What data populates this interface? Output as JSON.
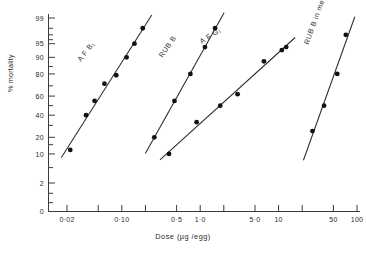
{
  "chart_data": {
    "type": "scatter",
    "title": "",
    "xlabel": "Dose (µg /egg)",
    "ylabel": "% mortality",
    "xscale": "log",
    "yscale": "probit",
    "xlim": [
      0.015,
      120
    ],
    "ylim": [
      0,
      99
    ],
    "grid": false,
    "legend": "inline-labels",
    "xticks": [
      "0·02",
      "0·10",
      "0·5",
      "1·0",
      "5·0",
      "10",
      "50",
      "100"
    ],
    "xtick_values": [
      0.02,
      0.1,
      0.5,
      1.0,
      5.0,
      10,
      50,
      100
    ],
    "yticks": [
      "99",
      "95",
      "90",
      "80",
      "60",
      "40",
      "20",
      "10",
      "2",
      "0"
    ],
    "ytick_values": [
      99,
      95,
      90,
      80,
      60,
      40,
      20,
      10,
      2,
      0
    ],
    "series": [
      {
        "name": "A.F. B₁",
        "label": "A F  B₁",
        "points": [
          {
            "x": 0.022,
            "y": 12
          },
          {
            "x": 0.035,
            "y": 40
          },
          {
            "x": 0.045,
            "y": 55
          },
          {
            "x": 0.06,
            "y": 72
          },
          {
            "x": 0.085,
            "y": 79
          },
          {
            "x": 0.115,
            "y": 90
          },
          {
            "x": 0.145,
            "y": 95
          },
          {
            "x": 0.185,
            "y": 98
          }
        ]
      },
      {
        "name": "RUB B",
        "label": "RUB  B",
        "points": [
          {
            "x": 0.26,
            "y": 20
          },
          {
            "x": 0.47,
            "y": 55
          },
          {
            "x": 0.75,
            "y": 80
          },
          {
            "x": 1.15,
            "y": 94
          },
          {
            "x": 1.55,
            "y": 98
          }
        ]
      },
      {
        "name": "A.F. G₁",
        "label": "A F  G₁",
        "points": [
          {
            "x": 0.4,
            "y": 10
          },
          {
            "x": 0.9,
            "y": 33
          },
          {
            "x": 1.8,
            "y": 50
          },
          {
            "x": 3.0,
            "y": 62
          },
          {
            "x": 6.5,
            "y": 88
          },
          {
            "x": 11.0,
            "y": 93
          },
          {
            "x": 12.5,
            "y": 94
          }
        ]
      },
      {
        "name": "RUB B in medium",
        "label": "RUB  B  in  medium",
        "points": [
          {
            "x": 27,
            "y": 25
          },
          {
            "x": 38,
            "y": 50
          },
          {
            "x": 56,
            "y": 80
          },
          {
            "x": 72,
            "y": 97
          }
        ]
      }
    ]
  },
  "axis": {
    "y_title": "% mortality",
    "x_title": "Dose (µg /egg)"
  }
}
